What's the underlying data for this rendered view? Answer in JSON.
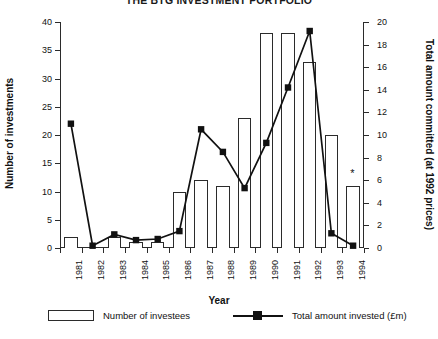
{
  "chart_data": {
    "type": "bar",
    "title": "THE BTG INVESTMENT PORTFOLIO",
    "xlabel": "Year",
    "ylabel": "Number of investments",
    "y2label": "Total amount committed (at 1992 prices)",
    "categories": [
      "1981",
      "1982",
      "1983",
      "1984",
      "1985",
      "1986",
      "1987",
      "1988",
      "1989",
      "1990",
      "1991",
      "1992",
      "1993",
      "1994"
    ],
    "ylim": [
      0,
      40
    ],
    "y2lim": [
      0,
      20
    ],
    "yticks": [
      "0",
      "5",
      "10",
      "15",
      "20",
      "25",
      "30",
      "35",
      "40"
    ],
    "y2ticks": [
      "0",
      "2",
      "4",
      "6",
      "8",
      "10",
      "12",
      "14",
      "16",
      "18",
      "20"
    ],
    "grid": false,
    "legend_position": "bottom",
    "series": [
      {
        "name": "Number of investees",
        "type": "bar",
        "axis": "left",
        "values": [
          2,
          0,
          2,
          1,
          1,
          10,
          12,
          11,
          23,
          38,
          38,
          33,
          20,
          11
        ]
      },
      {
        "name": "Total amount invested (£m)",
        "type": "line",
        "axis": "right",
        "marker": "filled-square",
        "values": [
          11.0,
          0.2,
          1.2,
          0.7,
          0.8,
          1.5,
          10.5,
          8.5,
          5.3,
          9.3,
          14.2,
          19.2,
          1.3,
          0.2
        ]
      }
    ],
    "annotations": [
      {
        "text": "*",
        "category": "1994",
        "note": "asterisk above 1994 bar"
      }
    ],
    "colors": {
      "bar_fill": "#ffffff",
      "bar_stroke": "#2b2b2b",
      "line": "#111111",
      "marker": "#111111",
      "axis": "#2b2b2b",
      "text": "#111111"
    }
  },
  "legend": {
    "items": [
      {
        "label": "Number of investees"
      },
      {
        "label": "Total amount invested (£m)"
      }
    ]
  }
}
